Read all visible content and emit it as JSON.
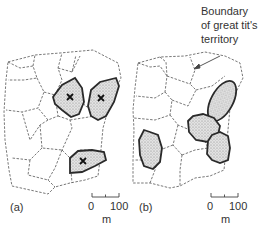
{
  "annotation": {
    "lines": [
      "Boundary",
      "of great tit's",
      "territory"
    ]
  },
  "panels": [
    {
      "label": "(a)",
      "marked_territories": 3,
      "scale": {
        "start": "0",
        "end": "100",
        "unit": "m"
      }
    },
    {
      "label": "(b)",
      "marked_territories": 4,
      "scale": {
        "start": "0",
        "end": "100",
        "unit": "m"
      }
    }
  ],
  "colors": {
    "territory_fill": "#d4d4d4",
    "territory_stroke": "#2a2a2a",
    "boundary_dash": "#555555"
  }
}
